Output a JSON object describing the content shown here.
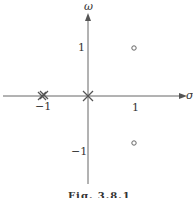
{
  "figure": {
    "caption": "Fig. 3.8.1",
    "x_axis_label": "σ",
    "y_axis_label": "ω",
    "tick_labels": {
      "x_neg1": "−1",
      "x_pos1": "1",
      "y_pos1": "1",
      "y_neg1": "−1"
    }
  },
  "pole_zero_plot": {
    "poles": [
      {
        "re": 0,
        "im": 0,
        "order": 1,
        "marker": "x"
      },
      {
        "re": -1,
        "im": 0,
        "order": 2,
        "marker": "double-x"
      }
    ],
    "zeros": [
      {
        "re": 1,
        "im": 1,
        "marker": "o"
      },
      {
        "re": 1,
        "im": -1,
        "marker": "o"
      }
    ],
    "colors": {
      "ink": "#555555"
    }
  }
}
